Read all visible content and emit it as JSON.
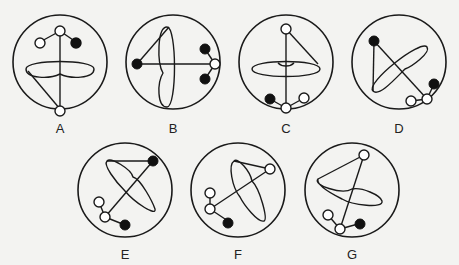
{
  "figures": [
    {
      "label": "A",
      "x": 10,
      "y": 20,
      "cx": 60,
      "cy": 60,
      "r": 48
    },
    {
      "label": "B",
      "x": 123,
      "y": 20,
      "cx": 60,
      "cy": 60,
      "r": 48
    },
    {
      "label": "C",
      "x": 236,
      "y": 20,
      "cx": 60,
      "cy": 60,
      "r": 48
    },
    {
      "label": "D",
      "x": 349,
      "y": 20,
      "cx": 60,
      "cy": 60,
      "r": 48
    },
    {
      "label": "E",
      "x": 65,
      "y": 138,
      "cx": 60,
      "cy": 60,
      "r": 48
    },
    {
      "label": "F",
      "x": 178,
      "y": 138,
      "cx": 60,
      "cy": 60,
      "r": 48
    },
    {
      "label": "G",
      "x": 291,
      "y": 138,
      "cx": 60,
      "cy": 60,
      "r": 48
    }
  ],
  "colors": {
    "stroke": "#1a1a1a",
    "filled_node": "#111111",
    "hollow_node": "#ffffff",
    "background": "#f3f3f1"
  }
}
